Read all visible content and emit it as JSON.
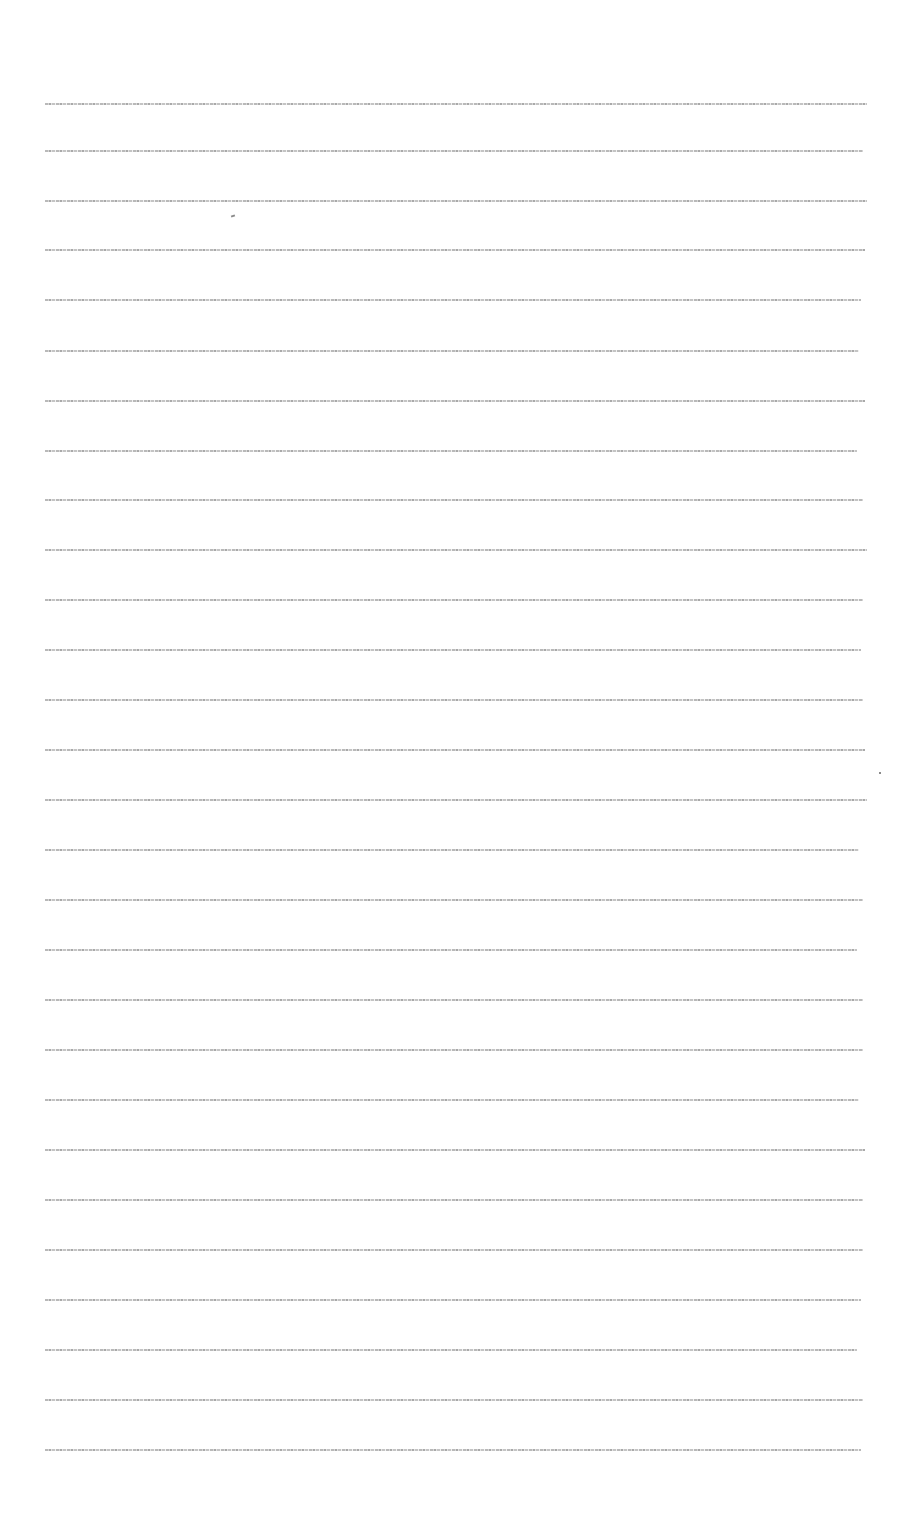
{
  "document": {
    "description": "Page of extremely small, illegible text lines",
    "line_count": 28,
    "lines": [
      {
        "y": 102,
        "text": "(illegible)"
      },
      {
        "y": 149,
        "text": "(illegible)"
      },
      {
        "y": 199,
        "text": "(illegible)"
      },
      {
        "y": 248,
        "text": "(illegible)"
      },
      {
        "y": 298,
        "text": "(illegible)"
      },
      {
        "y": 349,
        "text": "(illegible)"
      },
      {
        "y": 399,
        "text": "(illegible)"
      },
      {
        "y": 449,
        "text": "(illegible)"
      },
      {
        "y": 498,
        "text": "(illegible)"
      },
      {
        "y": 548,
        "text": "(illegible)"
      },
      {
        "y": 598,
        "text": "(illegible)"
      },
      {
        "y": 648,
        "text": "(illegible)"
      },
      {
        "y": 698,
        "text": "(illegible)"
      },
      {
        "y": 748,
        "text": "(illegible)"
      },
      {
        "y": 798,
        "text": "(illegible)"
      },
      {
        "y": 848,
        "text": "(illegible)"
      },
      {
        "y": 898,
        "text": "(illegible)"
      },
      {
        "y": 948,
        "text": "(illegible)"
      },
      {
        "y": 998,
        "text": "(illegible)"
      },
      {
        "y": 1048,
        "text": "(illegible)"
      },
      {
        "y": 1098,
        "text": "(illegible)"
      },
      {
        "y": 1148,
        "text": "(illegible)"
      },
      {
        "y": 1198,
        "text": "(illegible)"
      },
      {
        "y": 1248,
        "text": "(illegible)"
      },
      {
        "y": 1298,
        "text": "(illegible)"
      },
      {
        "y": 1348,
        "text": "(illegible)"
      },
      {
        "y": 1398,
        "text": "(illegible)"
      },
      {
        "y": 1448,
        "text": "(illegible)"
      }
    ]
  }
}
